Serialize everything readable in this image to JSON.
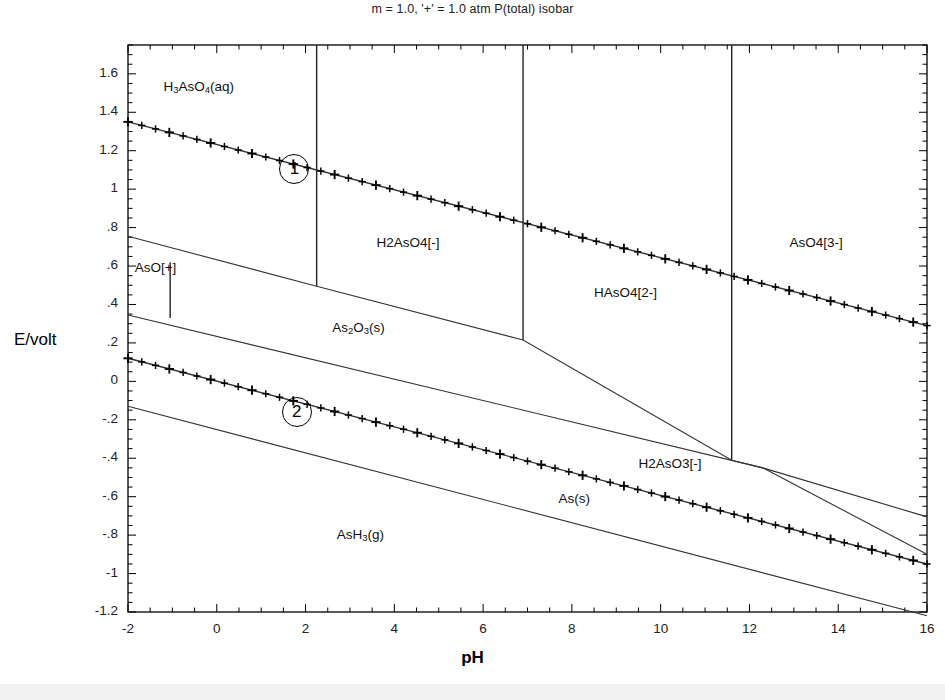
{
  "chart_data": {
    "type": "line",
    "title": "m = 1.0, '+' = 1.0 atm P(total) isobar",
    "xlabel": "pH",
    "ylabel": "E/volt",
    "xlim": [
      -2,
      16
    ],
    "ylim": [
      -1.2,
      1.75
    ],
    "grid": false,
    "legend": "none",
    "xticks": [
      "-2",
      "0",
      "2",
      "4",
      "6",
      "8",
      "10",
      "12",
      "14",
      "16"
    ],
    "xtick_values": [
      -2,
      0,
      2,
      4,
      6,
      8,
      10,
      12,
      14,
      16
    ],
    "yticks": [
      "1.6",
      "1.4",
      "1.2",
      "1",
      ".8",
      ".6",
      ".4",
      ".2",
      "0",
      "-.2",
      "-.4",
      "-.6",
      "-.8",
      "-1",
      "-1.2"
    ],
    "ytick_values": [
      1.6,
      1.4,
      1.2,
      1,
      0.8,
      0.6,
      0.4,
      0.2,
      0,
      -0.2,
      -0.4,
      -0.6,
      -0.8,
      -1,
      -1.2
    ],
    "series": [
      {
        "name": "O2/H2O line (marked with + isobar ticks)",
        "style": "line-with-plus-markers",
        "points": [
          [
            -2,
            1.35
          ],
          [
            16,
            0.29
          ]
        ]
      },
      {
        "name": "H2O/H2 line (marked with + isobar ticks)",
        "style": "line-with-plus-markers",
        "points": [
          [
            -2,
            0.12
          ],
          [
            16,
            -0.95
          ]
        ]
      },
      {
        "name": "AsH3(g) lower boundary",
        "style": "plain-line",
        "points": [
          [
            -2,
            -0.13
          ],
          [
            16,
            -1.22
          ]
        ]
      },
      {
        "name": "AsO[+] / As2O3(s) upper boundary",
        "style": "plain-line",
        "points": [
          [
            -2,
            0.755
          ],
          [
            2.25,
            0.495
          ],
          [
            6.9,
            0.215
          ],
          [
            11.6,
            -0.41
          ],
          [
            12.3,
            -0.45
          ]
        ]
      },
      {
        "name": "As2O3(s) / As(s) boundary",
        "style": "plain-line",
        "points": [
          [
            -2,
            0.345
          ],
          [
            12.3,
            -0.45
          ],
          [
            16,
            -0.705
          ]
        ]
      },
      {
        "name": "H2AsO3[-] lower boundary to corner",
        "style": "plain-line",
        "points": [
          [
            12.3,
            -0.45
          ],
          [
            16,
            -0.9
          ]
        ]
      }
    ],
    "vertical_boundaries": [
      {
        "ph": 2.25,
        "from": 1.75,
        "to": 0.495
      },
      {
        "ph": 6.9,
        "from": 1.75,
        "to": 0.215
      },
      {
        "ph": 11.6,
        "from": 1.75,
        "to": -0.41
      },
      {
        "ph": -1.05,
        "from": 0.62,
        "to": 0.33
      }
    ],
    "region_labels": [
      {
        "text": "H3AsO4(aq)",
        "formula_html": "H<sub>3</sub>AsO<sub>4</sub>(aq)",
        "ph": -1.2,
        "e": 1.53
      },
      {
        "text": "H2AsO4[-]",
        "ph": 3.6,
        "e": 0.72
      },
      {
        "text": "HAsO4[2-]",
        "ph": 8.5,
        "e": 0.46
      },
      {
        "text": "AsO4[3-]",
        "ph": 12.9,
        "e": 0.72
      },
      {
        "text": "AsO[+]",
        "ph": -1.85,
        "e": 0.59
      },
      {
        "text": "As2O3(s)",
        "formula_html": "As<sub>2</sub>O<sub>3</sub>(s)",
        "ph": 2.6,
        "e": 0.28
      },
      {
        "text": "H2AsO3[-]",
        "ph": 9.5,
        "e": -0.43
      },
      {
        "text": "As(s)",
        "ph": 7.7,
        "e": -0.61
      },
      {
        "text": "AsH3(g)",
        "formula_html": "AsH<sub>3</sub>(g)",
        "ph": 2.7,
        "e": -0.8
      }
    ],
    "annotations": [
      {
        "label": "1",
        "shape": "circled-number",
        "ph": 1.75,
        "e": 1.105
      },
      {
        "label": "2",
        "shape": "circled-number",
        "ph": 1.8,
        "e": -0.16
      }
    ]
  },
  "labels": {
    "title": "m = 1.0, '+' = 1.0 atm P(total) isobar",
    "y_axis": "E/volt",
    "x_axis": "pH",
    "marker_1": "1",
    "marker_2": "2",
    "species": {
      "h3aso4": "H3AsO4(aq)",
      "h2aso4_minus": "H2AsO4[-]",
      "haso4_2minus": "HAsO4[2-]",
      "aso4_3minus": "AsO4[3-]",
      "aso_plus": "AsO[+]",
      "as2o3": "As2O3(s)",
      "h2aso3_minus": "H2AsO3[-]",
      "as_s": "As(s)",
      "ash3": "AsH3(g)"
    }
  },
  "colors": {
    "background": "#ffffff",
    "line": "#333333",
    "axis": "#000000",
    "text": "#1a1a1a"
  }
}
